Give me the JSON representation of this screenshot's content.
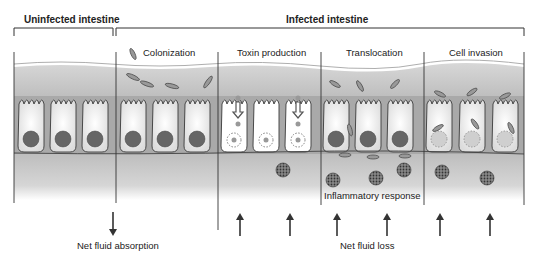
{
  "headers": {
    "uninfected": "Uninfected intestine",
    "infected": "Infected intestine"
  },
  "stages": [
    {
      "label": "Colonization"
    },
    {
      "label": "Toxin production"
    },
    {
      "label": "Translocation"
    },
    {
      "label": "Cell invasion"
    }
  ],
  "annotations": {
    "inflammatory": "Inflammatory response",
    "absorption": "Net fluid absorption",
    "loss": "Net fluid loss"
  },
  "colors": {
    "lumen": "#c9c9c9",
    "cell_fill": "#f2f2f2",
    "nucleus": "#666666",
    "outline": "#3a3a3a",
    "submucosa": "#c4c4c4"
  }
}
